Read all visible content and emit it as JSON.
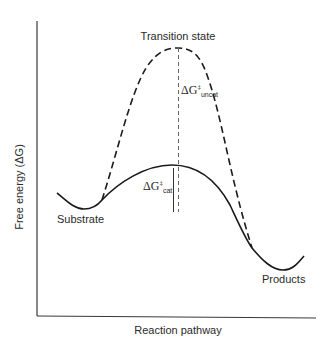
{
  "diagram": {
    "type": "reaction-energy-profile",
    "y_axis_label": "Free energy (ΔG)",
    "x_axis_label": "Reaction pathway",
    "labels": {
      "transition_state": "Transition state",
      "substrate": "Substrate",
      "products": "Products",
      "delta_g_symbol": "ΔG",
      "double_dagger": "‡",
      "uncat_sub": "uncat",
      "cat_sub": "cat"
    },
    "curves": [
      {
        "name": "catalyzed",
        "style": "solid"
      },
      {
        "name": "uncatalyzed",
        "style": "dashed"
      }
    ],
    "colors": {
      "line": "#1a1a1a",
      "axis": "#3a3a3a",
      "text": "#2a2a2a"
    }
  }
}
